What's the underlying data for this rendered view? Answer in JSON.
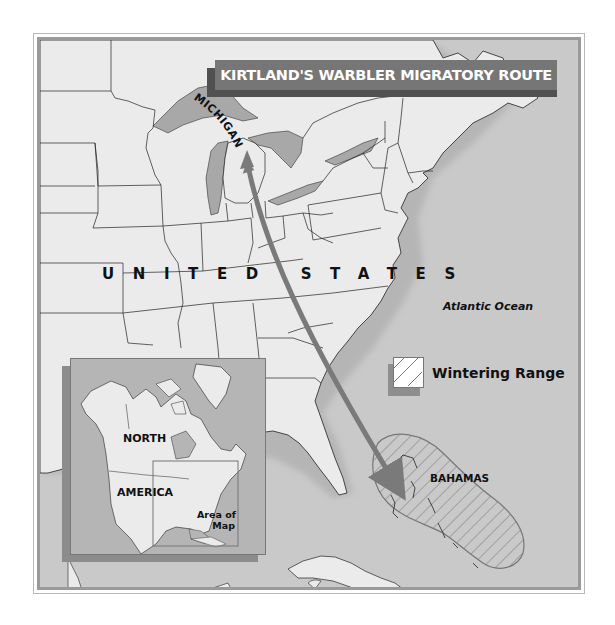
{
  "map": {
    "title": "KIRTLAND'S WARBLER MIGRATORY ROUTE",
    "labels": {
      "country": "UNITED STATES",
      "state": "MICHIGAN",
      "ocean": "Atlantic Ocean",
      "destination": "BAHAMAS"
    },
    "legend": {
      "items": [
        {
          "label": "Wintering Range",
          "pattern": "diagonal-hatch"
        }
      ]
    },
    "route": {
      "from": "MICHIGAN",
      "to": "BAHAMAS",
      "direction": "bidirectional",
      "color": "#7a7a7a"
    },
    "inset": {
      "label_line1": "NORTH",
      "label_line2": "AMERICA",
      "area_label_line1": "Area of",
      "area_label_line2": "Map"
    },
    "colors": {
      "land": "#ebebeb",
      "water": "#c9c9c9",
      "lakes": "#a8a8a8",
      "title_bar": "#767676",
      "title_shadow": "#505050",
      "route_arrow": "#7a7a7a",
      "frame": "#9a9a9a"
    }
  }
}
